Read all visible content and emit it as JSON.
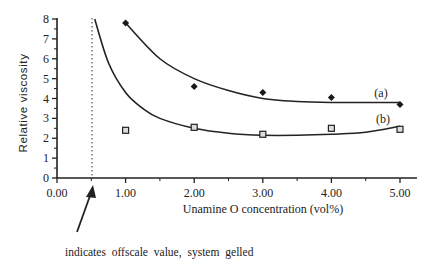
{
  "chart_data": {
    "type": "scatter",
    "title": "",
    "xlabel": "Unamine O concentration (vol%)",
    "ylabel": "Relative viscosity",
    "xlim": [
      0,
      5
    ],
    "ylim": [
      0,
      8
    ],
    "x_ticks": [
      "0.00",
      "1.00",
      "2.00",
      "3.00",
      "4.00",
      "5.00"
    ],
    "y_ticks": [
      "0",
      "1",
      "2",
      "3",
      "4",
      "5",
      "6",
      "7",
      "8"
    ],
    "grid": false,
    "legend": "inline labels at right end of curves",
    "series": [
      {
        "name": "(a)",
        "marker": "filled-diamond",
        "x": [
          1.0,
          2.0,
          3.0,
          4.0,
          5.0
        ],
        "values": [
          7.8,
          4.6,
          4.3,
          4.05,
          3.7
        ],
        "fit_curve": [
          [
            1.0,
            7.8
          ],
          [
            1.5,
            6.0
          ],
          [
            2.0,
            5.0
          ],
          [
            2.5,
            4.4
          ],
          [
            3.0,
            4.0
          ],
          [
            3.5,
            3.85
          ],
          [
            4.0,
            3.8
          ],
          [
            4.5,
            3.8
          ],
          [
            5.0,
            3.8
          ]
        ]
      },
      {
        "name": "(b)",
        "marker": "open-square",
        "x": [
          1.0,
          2.0,
          3.0,
          4.0,
          5.0
        ],
        "values": [
          2.4,
          2.55,
          2.2,
          2.5,
          2.45
        ],
        "fit_curve": [
          [
            0.55,
            8.0
          ],
          [
            0.75,
            5.8
          ],
          [
            1.0,
            4.3
          ],
          [
            1.25,
            3.5
          ],
          [
            1.5,
            3.0
          ],
          [
            2.0,
            2.5
          ],
          [
            2.5,
            2.25
          ],
          [
            3.0,
            2.15
          ],
          [
            3.5,
            2.15
          ],
          [
            4.0,
            2.2
          ],
          [
            4.5,
            2.3
          ],
          [
            5.0,
            2.6
          ]
        ]
      }
    ],
    "annotations": [
      {
        "type": "dotted-vertical-line",
        "x": 0.5
      },
      {
        "type": "arrow",
        "text": "indicates offscale value, system gelled",
        "points_to_x": 0.5
      }
    ]
  },
  "labels": {
    "series_a": "(a)",
    "series_b": "(b)",
    "note": "indicates offscale value, system gelled",
    "xlabel": "Unamine O concentration (vol%)",
    "ylabel": "Relative viscosity"
  },
  "ticks": {
    "x": [
      "0.00",
      "1.00",
      "2.00",
      "3.00",
      "4.00",
      "5.00"
    ],
    "y": [
      "0",
      "1",
      "2",
      "3",
      "4",
      "5",
      "6",
      "7",
      "8"
    ]
  }
}
